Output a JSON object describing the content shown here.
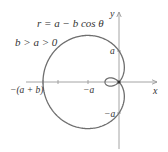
{
  "figure": {
    "equation": "r = a − b cos θ",
    "condition": "b > a > 0",
    "axis_x_label": "x",
    "axis_y_label": "y",
    "tick_labels": {
      "left_extent": "−(a + b)",
      "neg_a_x": "−a",
      "pos_a_y": "a",
      "neg_a_y": "−a"
    },
    "colors": {
      "curve": "#6e6e6e",
      "axes": "#9a9a9a",
      "text": "#333333"
    }
  },
  "chart_data": {
    "type": "polar-curve",
    "title": "r = a − b cos θ",
    "subtitle": "b > a > 0",
    "curve": "limacon with inner loop",
    "params": {
      "a": 31,
      "b": 45
    },
    "origin_px": [
      119,
      82
    ],
    "xlabel": "x",
    "ylabel": "y",
    "x_ticks": [
      "−(a + b)",
      "−a"
    ],
    "y_ticks": [
      "a",
      "−a"
    ]
  }
}
